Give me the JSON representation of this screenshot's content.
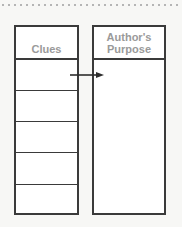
{
  "diagram": {
    "type": "graphic-organizer",
    "left_column": {
      "header": "Clues",
      "rows": [
        "",
        "",
        "",
        "",
        ""
      ]
    },
    "right_column": {
      "header_line1": "Author's",
      "header_line2": "Purpose",
      "content": ""
    },
    "connector": {
      "from": "left_column.rows.0",
      "to": "right_column",
      "icon": "arrow-right-icon"
    },
    "colors": {
      "border": "#3a3a3a",
      "header_text": "#9a9a9a",
      "background": "#f7f7f5"
    }
  }
}
